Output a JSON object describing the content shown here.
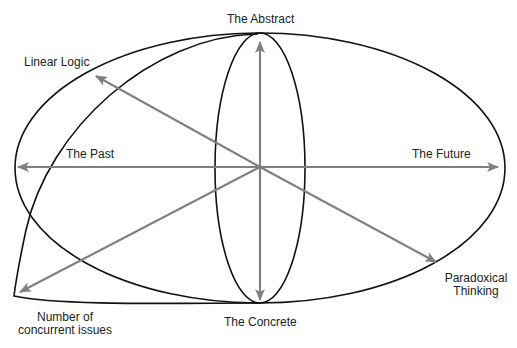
{
  "diagram": {
    "colors": {
      "outline": "#111111",
      "arrow": "#808080",
      "text": "#222222",
      "background": "#ffffff"
    },
    "center": [
      260,
      167
    ],
    "labels": {
      "abstract": "The Abstract",
      "concrete": "The Concrete",
      "past": "The Past",
      "future": "The Future",
      "linear_logic": "Linear Logic",
      "paradoxical_line1": "Paradoxical",
      "paradoxical_line2": "Thinking",
      "concurrent_line1": "Number of",
      "concurrent_line2": "concurrent issues"
    },
    "axes": [
      {
        "name": "The Abstract",
        "direction": "up"
      },
      {
        "name": "The Concrete",
        "direction": "down"
      },
      {
        "name": "The Past",
        "direction": "left"
      },
      {
        "name": "The Future",
        "direction": "right"
      },
      {
        "name": "Linear Logic",
        "direction": "upper-left"
      },
      {
        "name": "Paradoxical Thinking",
        "direction": "lower-right"
      },
      {
        "name": "Number of concurrent issues",
        "direction": "lower-left"
      }
    ]
  }
}
